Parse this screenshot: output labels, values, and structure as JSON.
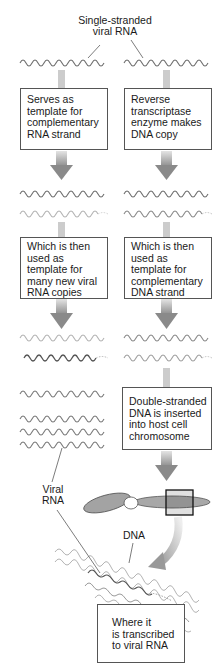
{
  "title_label": [
    "Single-stranded",
    "viral RNA"
  ],
  "left_path": {
    "box1": [
      "Serves as",
      "template for",
      "complementary",
      "RNA strand"
    ],
    "box2": [
      "Which is then",
      "used as",
      "template  for",
      "many new viral",
      "RNA copies"
    ]
  },
  "right_path": {
    "box1": [
      "Reverse",
      "transcriptase",
      "enzyme makes",
      "DNA copy"
    ],
    "box2": [
      "Which is then",
      "used as",
      "template  for",
      "complementary",
      "DNA strand"
    ],
    "box3": [
      "Double-stranded",
      "DNA is inserted",
      "into host cell",
      "chromosome"
    ]
  },
  "final_box": [
    "Where it",
    "is transcribed",
    "to viral RNA"
  ],
  "labels": {
    "viral_rna": [
      "Viral",
      "RNA"
    ],
    "dna": "DNA"
  },
  "colors": {
    "strand_dark": "#6e6e6e",
    "strand_light": "#b4b4b4",
    "arrow": "#8c8c8c",
    "chromosome": "#a0a0a0",
    "box_border": "#555555"
  }
}
